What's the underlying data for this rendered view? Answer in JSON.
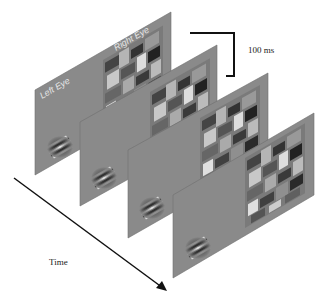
{
  "labels": {
    "left_eye": "Left Eye",
    "right_eye": "Right Eye",
    "interval": "100 ms",
    "time_axis": "Time"
  },
  "colors": {
    "panel_gray": "#8a8a8a",
    "panel_edge": "#6e6e6e",
    "arrow": "#111111",
    "bracket": "#111111",
    "label_text": "#222222",
    "eye_label_text": "#e6e6e6"
  },
  "panels": [
    {
      "index": 1,
      "gabor_orientation": "oblique",
      "mask": "mondrian"
    },
    {
      "index": 2,
      "gabor_orientation": "oblique",
      "mask": "mondrian"
    },
    {
      "index": 3,
      "gabor_orientation": "oblique",
      "mask": "mondrian"
    },
    {
      "index": 4,
      "gabor_orientation": "oblique",
      "mask": "mondrian"
    }
  ]
}
